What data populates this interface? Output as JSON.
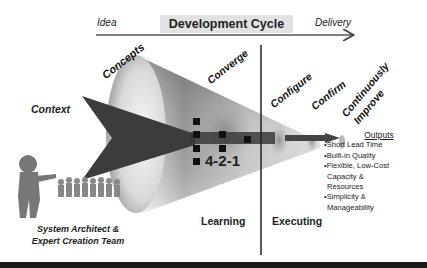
{
  "header": {
    "title": "Development Cycle",
    "start_label": "Idea",
    "end_label": "Delivery"
  },
  "funnel_labels": {
    "concepts": "Concepts",
    "converge": "Converge",
    "configure": "Configure",
    "confirm": "Confirm",
    "continuously": "Continuously",
    "improve": "Improve",
    "context": "Context"
  },
  "center_label": "4-2-1",
  "phases": {
    "learning": "Learning",
    "executing": "Executing"
  },
  "team_caption": {
    "line1": "System Architect &",
    "line2": "Expert Creation Team"
  },
  "outputs": {
    "title": "Outputs",
    "items": [
      "•Short Lead Time",
      "•Built-in Quality",
      "•Flexible, Low-Cost",
      " Capacity &",
      " Resources",
      "•Simplicity &",
      " Manageability"
    ]
  }
}
